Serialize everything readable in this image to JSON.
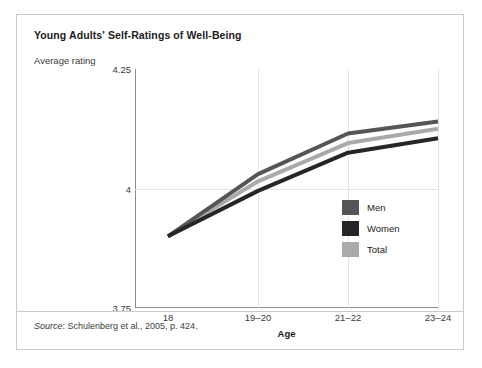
{
  "figure": {
    "title": "Young Adults' Self-Ratings of Well-Being",
    "source_word": "Source",
    "source_rest": ": Schulenberg et al., 2005, p. 424."
  },
  "chart_data": {
    "type": "line",
    "title": "Young Adults' Self-Ratings of Well-Being",
    "xlabel": "Age",
    "ylabel": "Average rating",
    "categories": [
      "18",
      "19–20",
      "21–22",
      "23–24"
    ],
    "ylim": [
      3.75,
      4.25
    ],
    "yticks": [
      3.75,
      4,
      4.25
    ],
    "ytick_labels": [
      "3.75",
      "4",
      "4.25"
    ],
    "grid": "xy",
    "legend_position": "inside-lower-right",
    "series": [
      {
        "name": "Men",
        "color": "#555555",
        "values": [
          3.9,
          4.03,
          4.115,
          4.14
        ]
      },
      {
        "name": "Women",
        "color": "#262626",
        "values": [
          3.9,
          3.995,
          4.075,
          4.105
        ]
      },
      {
        "name": "Total",
        "color": "#aaaaaa",
        "values": [
          3.9,
          4.015,
          4.095,
          4.125
        ]
      }
    ]
  }
}
